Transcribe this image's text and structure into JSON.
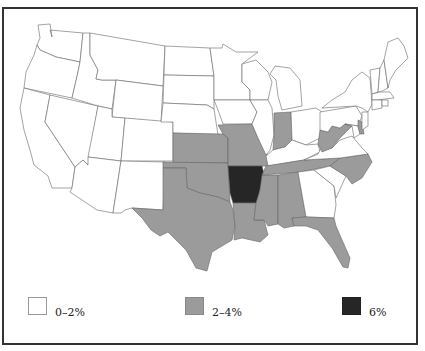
{
  "map": {
    "subject": "United States, contiguous states",
    "colors": {
      "low": "#ffffff",
      "mid": "#9b9b9b",
      "high": "#262626",
      "border": "#555555",
      "frame": "#333333"
    },
    "states_by_category": {
      "0-2%": [
        "WA",
        "OR",
        "CA",
        "ID",
        "NV",
        "MT",
        "WY",
        "UT",
        "AZ",
        "CO",
        "NM",
        "ND",
        "SD",
        "NE",
        "MN",
        "IA",
        "WI",
        "IL",
        "MI",
        "OH",
        "KY",
        "PA",
        "NY",
        "VA",
        "SC",
        "GA",
        "ME",
        "NH",
        "VT",
        "MA",
        "CT",
        "RI",
        "NJ",
        "MD"
      ],
      "2-4%": [
        "KS",
        "OK",
        "TX",
        "MO",
        "LA",
        "MS",
        "AL",
        "TN",
        "NC",
        "FL",
        "IN",
        "WV",
        "DE"
      ],
      "6%": [
        "AR"
      ]
    }
  },
  "legend": {
    "items": [
      {
        "label": "0–2%",
        "color": "#ffffff"
      },
      {
        "label": "2–4%",
        "color": "#9b9b9b"
      },
      {
        "label": "6%",
        "color": "#262626"
      }
    ]
  }
}
